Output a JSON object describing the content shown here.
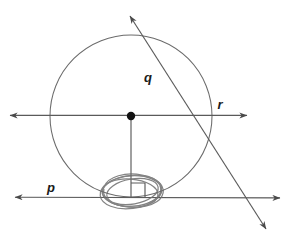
{
  "figure": {
    "background_color": "#ffffff",
    "stroke_color": "#555555",
    "ink_color": "#777777",
    "accent_color": "#1a1a1a",
    "width": 287,
    "height": 241
  },
  "labels": {
    "line_p": "p",
    "line_q": "q",
    "line_r": "r"
  },
  "label_positions": {
    "line_p": {
      "x": 51,
      "y": 192
    },
    "line_q": {
      "x": 148,
      "y": 82
    },
    "line_r": {
      "x": 220,
      "y": 109
    }
  },
  "circle": {
    "center": {
      "x": 131,
      "y": 116
    },
    "radius": 81,
    "center_dot_radius": 4.2
  },
  "lines": [
    {
      "name": "p",
      "role": "tangent-line",
      "from": {
        "x": 13,
        "y": 197
      },
      "to": {
        "x": 282,
        "y": 198
      },
      "arrows": "both"
    },
    {
      "name": "q",
      "role": "secant-line",
      "from": {
        "x": 128,
        "y": 13
      },
      "to": {
        "x": 268,
        "y": 232
      },
      "arrows": "both"
    },
    {
      "name": "r",
      "role": "diameter-line",
      "from": {
        "x": 8,
        "y": 115
      },
      "to": {
        "x": 249,
        "y": 115
      },
      "arrows": "both"
    }
  ],
  "radius_segment": {
    "role": "radius-to-tangent-point",
    "from": {
      "x": 131,
      "y": 116
    },
    "to": {
      "x": 131,
      "y": 197
    }
  },
  "right_angle_marker": {
    "role": "perpendicular-mark",
    "x": 124,
    "y": 183,
    "size": 14
  },
  "highlight_scribble": {
    "role": "hand-drawn-ellipse-annotation",
    "center": {
      "x": 131,
      "y": 192
    },
    "rx": 32,
    "ry": 17,
    "loops": 5
  }
}
